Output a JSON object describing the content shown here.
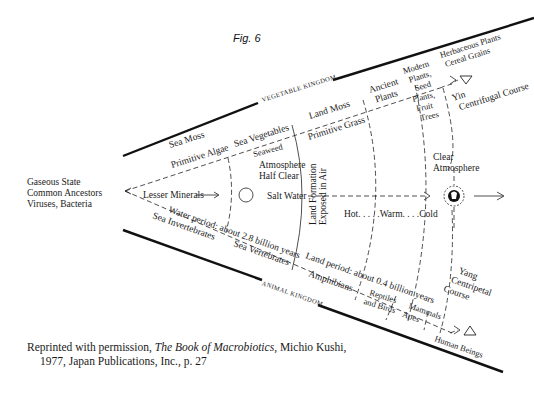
{
  "figure": {
    "title": "Fig. 6",
    "left_origin": [
      "Gaseous State",
      "Common Ancestors",
      "Viruses, Bacteria"
    ],
    "kingdoms": {
      "upper": "VEGETABLE KINGDOM",
      "lower": "ANIMAL KINGDOM"
    },
    "vegetable_labels": {
      "sea_moss": "Sea Moss",
      "primitive_algae": "Primitive Algae",
      "sea_vegetables": "Sea Vegetables",
      "seaweed": "Seaweed",
      "land_moss": "Land Moss",
      "primitive_grass": "Primitive Grass",
      "ancient_plants": [
        "Ancient",
        "Plants"
      ],
      "modern_plants_seed": [
        "Modern",
        "Plants,",
        "Seed"
      ],
      "plants_fruit_trees": [
        "Plants,",
        "Fruit",
        "Trees"
      ],
      "herbaceous": [
        "Herbaceous Plants",
        "Cereal Grains"
      ],
      "yin": [
        "Yin",
        "Centrifugal Course"
      ]
    },
    "center_labels": {
      "lesser_minerals": "Lesser Minerals",
      "atmosphere_half_clear": [
        "Atmosphere",
        "Half Clear"
      ],
      "salt_water": "Salt Water",
      "land_formation": [
        "Land Formation",
        "Exposed in Air"
      ],
      "temperature": "Hot. . . . .Warm. . . .Cold",
      "clear_atmosphere": [
        "Clear",
        "Atmosphere"
      ]
    },
    "animal_labels": {
      "water_period": "Water period: about 2.8 billion years",
      "sea_invertebrates": "Sea Invertebrates",
      "sea_vertebrates": "Sea Vertebrates",
      "land_period": "Land period: about 0.4 billion years",
      "amphibians": "Amphibians",
      "reptiles_birds": [
        "Reptiles",
        "and Birds"
      ],
      "mammals_apes": [
        "Mammals",
        "Apes"
      ],
      "human_beings": "Human Beings",
      "yang": [
        "Yang",
        "Centripetal",
        "Course"
      ]
    },
    "symbols": {
      "yin_symbol": "triangle-down",
      "yang_symbol": "triangle-up",
      "earth_symbol": "globe-circle"
    }
  },
  "caption": {
    "prefix": "Reprinted with permission, ",
    "book_title": "The Book of Macrobiotics",
    "suffix": ", Michio Kushi,",
    "line2": "1977, Japan Publications, Inc., p. 27"
  }
}
